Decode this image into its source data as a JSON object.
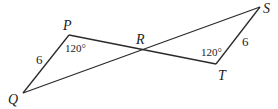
{
  "diagram": {
    "points": {
      "P": {
        "label": "P",
        "x": 69,
        "y": 35
      },
      "Q": {
        "label": "Q",
        "x": 23,
        "y": 93
      },
      "R": {
        "label": "R",
        "x": 141,
        "y": 50
      },
      "S": {
        "label": "S",
        "x": 260,
        "y": 7
      },
      "T": {
        "label": "T",
        "x": 216,
        "y": 64
      }
    },
    "segments": [
      [
        "P",
        "Q"
      ],
      [
        "P",
        "T"
      ],
      [
        "Q",
        "S"
      ],
      [
        "S",
        "T"
      ]
    ],
    "side_labels": {
      "PQ": "6",
      "ST": "6"
    },
    "angle_labels": {
      "P": "120°",
      "T": "120°"
    },
    "line_color": "#2a2a2a"
  }
}
